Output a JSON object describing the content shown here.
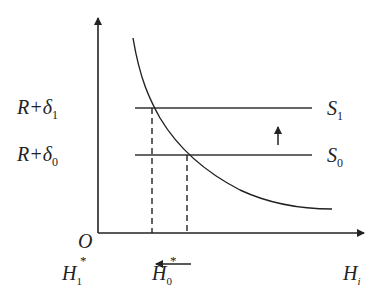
{
  "diagram": {
    "type": "economics-curve",
    "axes": {
      "origin_label": "O",
      "x_label": {
        "main": "H",
        "sub": "i"
      },
      "y_arrow": true
    },
    "y_labels": [
      {
        "id": "r-delta-1",
        "main": "R+δ",
        "sub": "1"
      },
      {
        "id": "r-delta-0",
        "main": "R+δ",
        "sub": "0"
      }
    ],
    "lines": [
      {
        "id": "S1",
        "main": "S",
        "sub": "1"
      },
      {
        "id": "S0",
        "main": "S",
        "sub": "0"
      }
    ],
    "x_points": [
      {
        "id": "H1-star",
        "main": "H",
        "sub": "1",
        "sup": "*"
      },
      {
        "id": "H0-star",
        "main": "H",
        "sub": "0",
        "sup": "*"
      }
    ],
    "shift_arrows": [
      {
        "id": "S-shift-up",
        "direction": "up",
        "between": [
          "S0",
          "S1"
        ]
      },
      {
        "id": "H-shift-left",
        "direction": "left",
        "from": "H0-star",
        "to": "H1-star"
      }
    ],
    "curve": {
      "shape": "downward-sloping convex",
      "intersects": [
        "S1",
        "S0"
      ]
    },
    "colors": {
      "stroke": "#222222",
      "background": "#ffffff"
    }
  }
}
